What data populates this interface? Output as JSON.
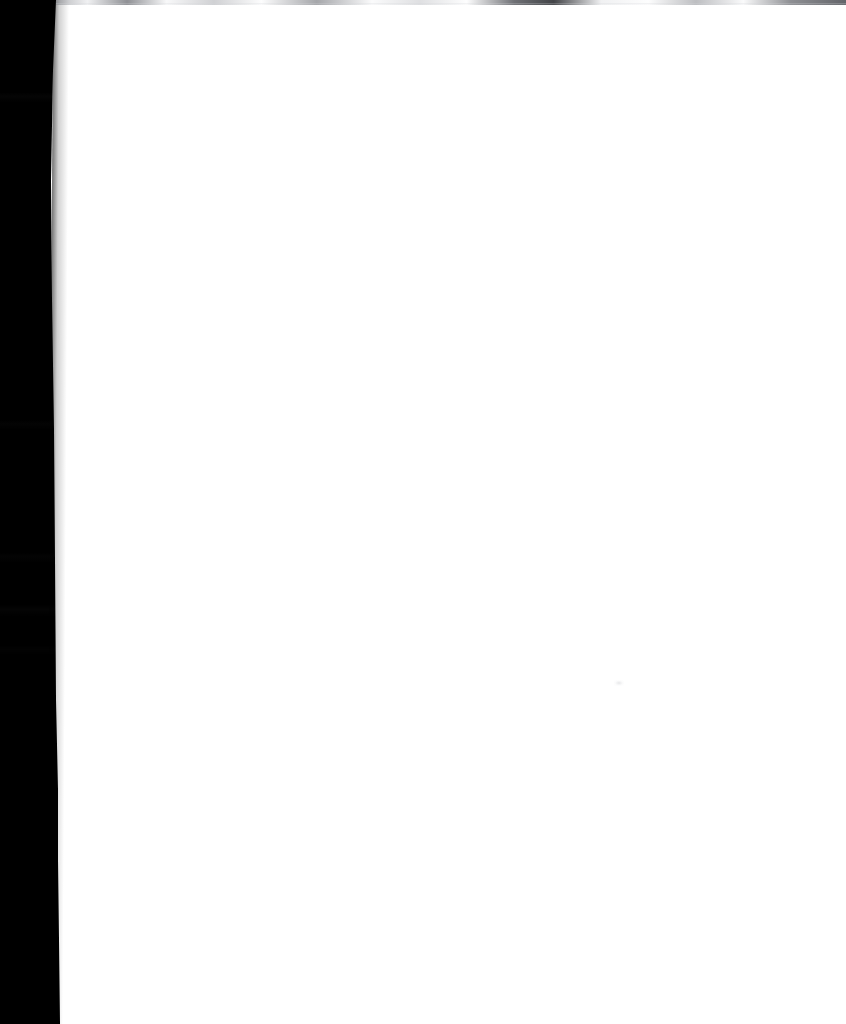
{
  "document": {
    "kind": "scanned-page-image",
    "page_state": "blank",
    "visible_text": "",
    "width": 846,
    "height": 1024,
    "orientation": "portrait"
  },
  "colors": {
    "scanner_backdrop": "#000000",
    "paper": "#ffffff",
    "paper_edge_shadow": "#000000",
    "torn_sliver_highlight": "#f2f2f0",
    "torn_sliver_midtone": "#9a9a98",
    "scan_line_top": "#6e7076",
    "scan_line_bottom": "#0a0a0c"
  },
  "regions": {
    "scanner_backdrop_label": "",
    "paper_sheet_label": "",
    "torn_sliver_label": "",
    "scan_line_top_label": "",
    "scan_line_bottom_label": "",
    "page_smudge_label": "",
    "content_field_label": ""
  }
}
